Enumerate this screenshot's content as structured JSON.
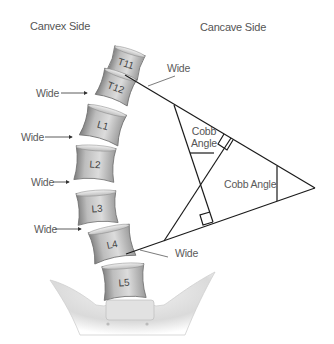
{
  "headers": {
    "convex": "Canvex Side",
    "concave": "Cancave Side"
  },
  "vertebrae": [
    {
      "label": "T11"
    },
    {
      "label": "T12"
    },
    {
      "label": "L1"
    },
    {
      "label": "L2"
    },
    {
      "label": "L3"
    },
    {
      "label": "L4"
    },
    {
      "label": "L5"
    }
  ],
  "wide_labels": {
    "left": [
      "Wide",
      "Wide",
      "Wide",
      "Wide"
    ],
    "top_right": "Wide",
    "bottom_right": "Wide"
  },
  "angle_labels": {
    "inner_line1": "Cobb",
    "inner_line2": "Angle",
    "outer": "Cobb Angle"
  },
  "colors": {
    "line": "#1a1a1a",
    "text": "#555555",
    "bone_light": "#e6e6e6",
    "bone_dark": "#8c8c8c"
  }
}
